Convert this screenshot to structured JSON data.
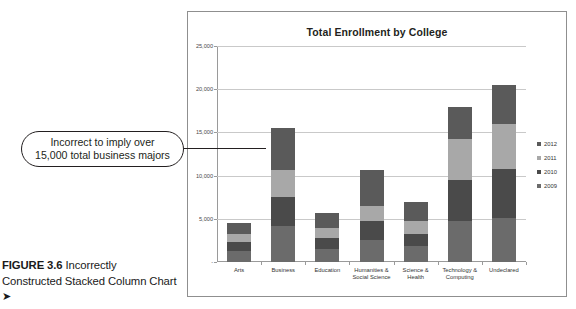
{
  "figure": {
    "label": "FIGURE 3.6",
    "caption": " Incorrectly Constructed Stacked Column Chart ",
    "arrow": "➤"
  },
  "callout": {
    "text": "Incorrect to imply over\n15,000 total business majors"
  },
  "chart_data": {
    "type": "bar",
    "title": "Total Enrollment by College",
    "xlabel": "",
    "ylabel": "",
    "stacked": true,
    "grid": true,
    "legend_position": "right",
    "ylim": [
      0,
      25000
    ],
    "yticks": [
      "-",
      "5,000",
      "10,000",
      "15,000",
      "20,000",
      "25,000"
    ],
    "ytick_values": [
      0,
      5000,
      10000,
      15000,
      20000,
      25000
    ],
    "categories": [
      "Arts",
      "Business",
      "Education",
      "Humanities &\nSocial Science",
      "Science &\nHealth",
      "Technology &\nComputing",
      "Undeclared"
    ],
    "series": [
      {
        "name": "2009",
        "color": "#6b6b6b",
        "values": [
          1300,
          4200,
          1500,
          2500,
          1800,
          4700,
          5100
        ]
      },
      {
        "name": "2010",
        "color": "#4a4a4a",
        "values": [
          1000,
          3300,
          1300,
          2300,
          1500,
          4800,
          5700
        ]
      },
      {
        "name": "2011",
        "color": "#a8a8a8",
        "values": [
          1000,
          3200,
          1100,
          1700,
          1500,
          4700,
          5200
        ]
      },
      {
        "name": "2012",
        "color": "#5a5a5a",
        "values": [
          1200,
          4800,
          1800,
          4100,
          2200,
          3800,
          4500
        ]
      }
    ],
    "totals": [
      4500,
      15500,
      5700,
      10600,
      7000,
      18000,
      20500
    ],
    "colors": {
      "2012": "#5a5a5a",
      "2011": "#a8a8a8",
      "2010": "#4a4a4a",
      "2009": "#6b6b6b",
      "gridline": "#c9c9c9",
      "axis": "#9a9a9a",
      "frame": "#8f8f8f",
      "text": "#231f20"
    }
  }
}
